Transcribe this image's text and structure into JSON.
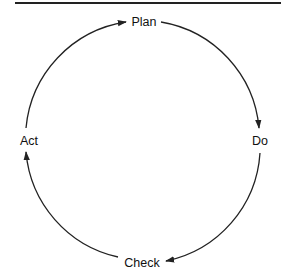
{
  "diagram": {
    "type": "cycle",
    "direction": "clockwise",
    "nodes": [
      {
        "id": "plan",
        "label": "Plan"
      },
      {
        "id": "do",
        "label": "Do"
      },
      {
        "id": "check",
        "label": "Check"
      },
      {
        "id": "act",
        "label": "Act"
      }
    ],
    "edges": [
      {
        "from": "plan",
        "to": "do"
      },
      {
        "from": "do",
        "to": "check"
      },
      {
        "from": "check",
        "to": "act"
      },
      {
        "from": "act",
        "to": "plan"
      }
    ],
    "colors": {
      "line": "#222222",
      "text": "#111111",
      "background": "#ffffff"
    }
  }
}
